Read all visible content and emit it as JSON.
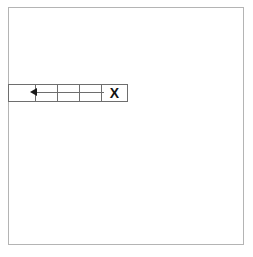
{
  "canvas": {
    "width": 253,
    "height": 257,
    "background_color": "#ffffff"
  },
  "outer_square": {
    "name": "drawing-area",
    "border_color": "#b4b4b4",
    "fill_color": "#ffffff",
    "x": 8,
    "y": 7,
    "width": 236,
    "height": 238
  },
  "cell_strip": {
    "name": "horizontal-cell-strip",
    "x": 8,
    "y": 84,
    "height": 18,
    "border_color": "#6e6e6e",
    "fill_color": "#ffffff",
    "cells": [
      {
        "id": "cell-0",
        "label": "",
        "width": 27,
        "content": "empty"
      },
      {
        "id": "cell-1",
        "label": "",
        "width": 22,
        "content": "arrow-head"
      },
      {
        "id": "cell-2",
        "label": "",
        "width": 22,
        "content": "arrow-shaft"
      },
      {
        "id": "cell-3",
        "label": "",
        "width": 22,
        "content": "arrow-shaft"
      },
      {
        "id": "cell-4",
        "label": "X",
        "width": 25,
        "content": "close-glyph"
      }
    ]
  },
  "arrow": {
    "name": "left-arrow",
    "direction": "left",
    "head_color": "#1a1a1a",
    "shaft_color": "#6e6e6e",
    "shaft_x": 33,
    "shaft_y": 92,
    "shaft_width": 71
  },
  "close_glyph": {
    "name": "close-x",
    "text": "X",
    "color": "#111111",
    "font_size": 14,
    "bold": true
  }
}
